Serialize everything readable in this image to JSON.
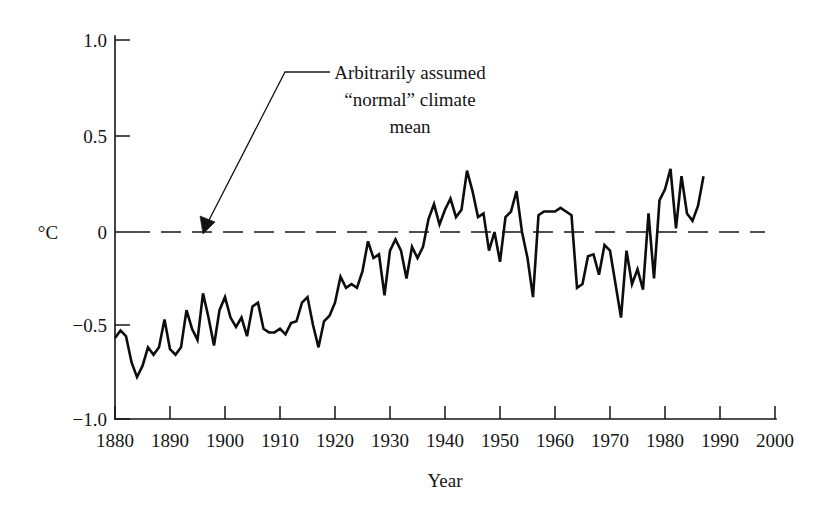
{
  "figure": {
    "width": 826,
    "height": 509,
    "background_color": "#ffffff",
    "ink_color": "#141414"
  },
  "annotation": {
    "line1": "Arbitrarily assumed",
    "line2": "“normal” climate",
    "line3": "mean",
    "points_to": "zero-reference-dashed-line"
  },
  "axes": {
    "y_unit_label": "°C",
    "x_axis_title": "Year",
    "y_ticks": [
      "1.0",
      "0.5",
      "0",
      "−0.5",
      "−1.0"
    ],
    "y_tick_values": [
      1.0,
      0.5,
      0,
      -0.5,
      -1.0
    ],
    "x_ticks": [
      "1880",
      "1890",
      "1900",
      "1910",
      "1920",
      "1930",
      "1940",
      "1950",
      "1960",
      "1970",
      "1980",
      "1990",
      "2000"
    ],
    "x_tick_values": [
      1880,
      1890,
      1900,
      1910,
      1920,
      1930,
      1940,
      1950,
      1960,
      1970,
      1980,
      1990,
      2000
    ]
  },
  "chart_data": {
    "type": "line",
    "title": "",
    "subtitle": "",
    "xlabel": "Year",
    "ylabel": "°C",
    "xlim": [
      1880,
      2000
    ],
    "ylim": [
      -1.0,
      1.0
    ],
    "grid": false,
    "legend": null,
    "annotations": [
      {
        "text": "Arbitrarily assumed “normal” climate mean",
        "target_y": 0.0,
        "target_x": 1896,
        "style": "arrow-with-leader"
      }
    ],
    "reference_lines": [
      {
        "y": 0.0,
        "style": "dashed",
        "label": "Arbitrarily assumed “normal” climate mean"
      }
    ],
    "series": [
      {
        "name": "Global mean temperature anomaly",
        "x": [
          1880,
          1881,
          1882,
          1883,
          1884,
          1885,
          1886,
          1887,
          1888,
          1889,
          1890,
          1891,
          1892,
          1893,
          1894,
          1895,
          1896,
          1897,
          1898,
          1899,
          1900,
          1901,
          1902,
          1903,
          1904,
          1905,
          1906,
          1907,
          1908,
          1909,
          1910,
          1911,
          1912,
          1913,
          1914,
          1915,
          1916,
          1917,
          1918,
          1919,
          1920,
          1921,
          1922,
          1923,
          1924,
          1925,
          1926,
          1927,
          1928,
          1929,
          1930,
          1931,
          1932,
          1933,
          1934,
          1935,
          1936,
          1937,
          1938,
          1939,
          1940,
          1941,
          1942,
          1943,
          1944,
          1945,
          1946,
          1947,
          1948,
          1949,
          1950,
          1951,
          1952,
          1953,
          1954,
          1955,
          1956,
          1957,
          1958,
          1959,
          1960,
          1961,
          1962,
          1963,
          1964,
          1965,
          1966,
          1967,
          1968,
          1969,
          1970,
          1971,
          1972,
          1973,
          1974,
          1975,
          1976,
          1977,
          1978,
          1979,
          1980,
          1981,
          1982,
          1983,
          1984,
          1985,
          1986,
          1987
        ],
        "values": [
          -0.57,
          -0.53,
          -0.56,
          -0.7,
          -0.78,
          -0.72,
          -0.62,
          -0.66,
          -0.62,
          -0.47,
          -0.63,
          -0.66,
          -0.62,
          -0.42,
          -0.52,
          -0.58,
          -0.33,
          -0.46,
          -0.61,
          -0.42,
          -0.35,
          -0.46,
          -0.51,
          -0.46,
          -0.56,
          -0.4,
          -0.38,
          -0.52,
          -0.54,
          -0.54,
          -0.52,
          -0.55,
          -0.49,
          -0.48,
          -0.38,
          -0.35,
          -0.5,
          -0.62,
          -0.48,
          -0.45,
          -0.38,
          -0.24,
          -0.3,
          -0.28,
          -0.3,
          -0.21,
          -0.05,
          -0.14,
          -0.12,
          -0.34,
          -0.1,
          -0.04,
          -0.1,
          -0.25,
          -0.08,
          -0.14,
          -0.08,
          0.07,
          0.15,
          0.04,
          0.12,
          0.18,
          0.08,
          0.12,
          0.33,
          0.22,
          0.08,
          0.1,
          -0.1,
          0.0,
          -0.16,
          0.08,
          0.11,
          0.22,
          0.0,
          -0.14,
          -0.35,
          0.09,
          0.11,
          0.11,
          0.11,
          0.13,
          0.11,
          0.09,
          -0.3,
          -0.28,
          -0.13,
          -0.12,
          -0.23,
          -0.07,
          -0.1,
          -0.28,
          -0.46,
          -0.1,
          -0.28,
          -0.2,
          -0.31,
          0.1,
          -0.25,
          0.17,
          0.23,
          0.34,
          0.02,
          0.3,
          0.1,
          0.06,
          0.14,
          0.3
        ]
      }
    ]
  }
}
